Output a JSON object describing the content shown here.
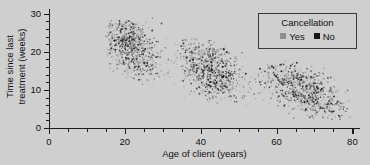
{
  "chart_data": {
    "type": "scatter",
    "title": "",
    "xlabel": "Age of client (years)",
    "ylabel": "Time since last treatment (weeks)",
    "ylabel_lines": [
      "Time since last",
      "treatment (weeks)"
    ],
    "xlim": [
      0,
      82
    ],
    "ylim": [
      0,
      31
    ],
    "xticks": [
      0,
      20,
      40,
      60,
      80
    ],
    "xtick_labels": [
      "0",
      "20",
      "40",
      "60",
      "80"
    ],
    "x_minor_step": 5,
    "yticks": [
      0,
      10,
      20,
      30
    ],
    "ytick_labels": [
      "0",
      "10",
      "20",
      "30"
    ],
    "y_minor_step": 2,
    "grid": false,
    "legend": {
      "title": "Cancellation",
      "position": "top-right",
      "entries": [
        {
          "label": "Yes",
          "color": "#8f8f8f",
          "marker": "square"
        },
        {
          "label": "No",
          "color": "#171717",
          "marker": "square"
        }
      ]
    },
    "colors": {
      "background": "#cfcfcf",
      "axis": "#1a1a1a",
      "text": "#111111",
      "yes_marker": "#8f8f8f",
      "no_marker": "#171717"
    },
    "clusters": [
      {
        "name": "young",
        "x_range": [
          15.5,
          31
        ],
        "y_range": [
          11,
          28.5
        ],
        "x_center": 21.5,
        "y_center": 21.5,
        "n": 620
      },
      {
        "name": "middle",
        "x_range": [
          34,
          53
        ],
        "y_range": [
          6.5,
          23.5
        ],
        "x_center": 42.5,
        "y_center": 15.5,
        "n": 700
      },
      {
        "name": "older",
        "x_range": [
          54,
          79.5
        ],
        "y_range": [
          2.5,
          17.5
        ],
        "x_center": 67,
        "y_center": 10.0,
        "n": 680
      }
    ],
    "trend": {
      "slope": -0.3,
      "intercept": 27.5,
      "note": "approximate linear decline from ~23 weeks at age 16 to ~6 weeks at age 78"
    },
    "series": [
      {
        "name": "Yes",
        "color": "#8f8f8f",
        "share": 0.55
      },
      {
        "name": "No",
        "color": "#171717",
        "share": 0.45
      }
    ]
  }
}
